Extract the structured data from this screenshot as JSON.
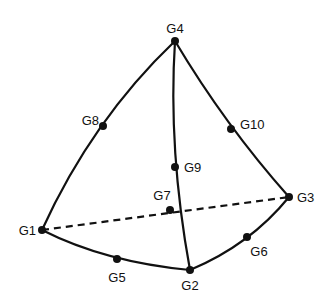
{
  "diagram": {
    "type": "quadratic tetrahedral element",
    "nodes": [
      {
        "id": "G1",
        "label": "G1",
        "x": 42,
        "y": 230,
        "lx": 36,
        "ly": 235,
        "anchor": "end"
      },
      {
        "id": "G2",
        "label": "G2",
        "x": 190,
        "y": 270,
        "lx": 190,
        "ly": 290,
        "anchor": "middle"
      },
      {
        "id": "G3",
        "label": "G3",
        "x": 289,
        "y": 197,
        "lx": 297,
        "ly": 202,
        "anchor": "start"
      },
      {
        "id": "G4",
        "label": "G4",
        "x": 175,
        "y": 41,
        "lx": 175,
        "ly": 33,
        "anchor": "middle"
      },
      {
        "id": "G5",
        "label": "G5",
        "x": 117,
        "y": 259,
        "lx": 117,
        "ly": 282,
        "anchor": "middle"
      },
      {
        "id": "G6",
        "label": "G6",
        "x": 247,
        "y": 237,
        "lx": 259,
        "ly": 256,
        "anchor": "middle"
      },
      {
        "id": "G7",
        "label": "G7",
        "x": 170,
        "y": 210,
        "lx": 162,
        "ly": 200,
        "anchor": "middle"
      },
      {
        "id": "G8",
        "label": "G8",
        "x": 103,
        "y": 126,
        "lx": 99,
        "ly": 125,
        "anchor": "end"
      },
      {
        "id": "G9",
        "label": "G9",
        "x": 175,
        "y": 167,
        "lx": 184,
        "ly": 172,
        "anchor": "start"
      },
      {
        "id": "G10",
        "label": "G10",
        "x": 231,
        "y": 129,
        "lx": 240,
        "ly": 129,
        "anchor": "start"
      }
    ],
    "edges": [
      {
        "name": "edge-g1-g4",
        "d": "M42,230 Q92,120 175,41",
        "hidden": false
      },
      {
        "name": "edge-g4-g3",
        "d": "M175,41 Q225,125 289,197",
        "hidden": false
      },
      {
        "name": "edge-g4-g2",
        "d": "M175,41 Q168,150 190,270",
        "hidden": false
      },
      {
        "name": "edge-g1-g2",
        "d": "M42,230 Q105,262 190,270",
        "hidden": false
      },
      {
        "name": "edge-g2-g3",
        "d": "M190,270 Q250,245 289,197",
        "hidden": false
      },
      {
        "name": "edge-g1-g3-hidden",
        "d": "M42,230 L289,197",
        "hidden": true
      }
    ]
  }
}
